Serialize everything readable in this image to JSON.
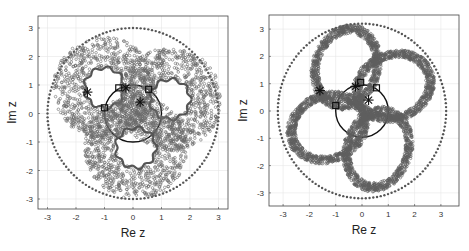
{
  "chart_data": [
    {
      "type": "scatter",
      "title": "",
      "xlabel": "Re z",
      "ylabel": "Im z",
      "xlim": [
        -3.3,
        3.3
      ],
      "ylim": [
        -3.3,
        3.3
      ],
      "xticks": [
        "-3",
        "-2",
        "-1",
        "0",
        "1",
        "2",
        "3"
      ],
      "yticks": [
        "3",
        "2",
        "1",
        "0",
        "-1",
        "-2",
        "-3"
      ],
      "grid": true,
      "series": [
        {
          "name": "outer dotted circle",
          "shape": "circle",
          "center": [
            0,
            0
          ],
          "radius": 3.0,
          "style": "dots"
        },
        {
          "name": "unit circle",
          "shape": "circle",
          "center": [
            0,
            0
          ],
          "radius": 1.0,
          "style": "solid"
        },
        {
          "name": "annulus regions",
          "shape": "annuli",
          "centers": [
            [
              -1.0,
              0.9
            ],
            [
              1.3,
              0.5
            ],
            [
              0.1,
              -1.2
            ]
          ],
          "inner_radius": 0.7,
          "outer_radius": 1.8,
          "style": "open-circle markers"
        },
        {
          "name": "star markers",
          "marker": "asterisk",
          "points": [
            [
              -1.6,
              0.75
            ],
            [
              -0.25,
              0.9
            ],
            [
              0.25,
              0.4
            ]
          ]
        },
        {
          "name": "square markers",
          "marker": "square",
          "points": [
            [
              -0.5,
              0.9
            ],
            [
              0.55,
              0.85
            ],
            [
              -1.0,
              0.2
            ]
          ]
        }
      ]
    },
    {
      "type": "scatter",
      "title": "",
      "xlabel": "Re z",
      "ylabel": "Im z",
      "xlim": [
        -3.5,
        3.5
      ],
      "ylim": [
        -3.5,
        3.5
      ],
      "xticks": [
        "-3",
        "-2",
        "-1",
        "0",
        "1",
        "2",
        "3"
      ],
      "yticks": [
        "3",
        "2",
        "1",
        "0",
        "-1",
        "-2",
        "-3"
      ],
      "grid": true,
      "series": [
        {
          "name": "outer dotted circle",
          "shape": "circle",
          "center": [
            0,
            0
          ],
          "radius": 3.2,
          "style": "dots"
        },
        {
          "name": "unit circle",
          "shape": "circle",
          "center": [
            0,
            0
          ],
          "radius": 1.0,
          "style": "solid"
        },
        {
          "name": "elliptic rings",
          "shape": "ellipse-rings",
          "rings": [
            {
              "center": [
                -0.6,
                1.6
              ],
              "rx": 1.3,
              "ry": 1.6,
              "rot": -20
            },
            {
              "center": [
                1.2,
                0.9
              ],
              "rx": 1.6,
              "ry": 1.3,
              "rot": 20
            },
            {
              "center": [
                0.6,
                -1.4
              ],
              "rx": 1.3,
              "ry": 1.6,
              "rot": -20
            },
            {
              "center": [
                -1.3,
                -0.6
              ],
              "rx": 1.6,
              "ry": 1.3,
              "rot": 20
            }
          ],
          "style": "dense open-circle markers"
        },
        {
          "name": "star markers",
          "marker": "asterisk",
          "points": [
            [
              -1.6,
              0.75
            ],
            [
              -0.25,
              0.9
            ],
            [
              0.25,
              0.4
            ]
          ]
        },
        {
          "name": "square markers",
          "marker": "square",
          "points": [
            [
              -0.05,
              1.05
            ],
            [
              0.55,
              0.85
            ],
            [
              -1.0,
              0.2
            ]
          ]
        }
      ]
    }
  ],
  "plots": [
    {
      "xlabel": "Re z",
      "ylabel": "Im z"
    },
    {
      "xlabel": "Re z",
      "ylabel": "Im z"
    }
  ]
}
